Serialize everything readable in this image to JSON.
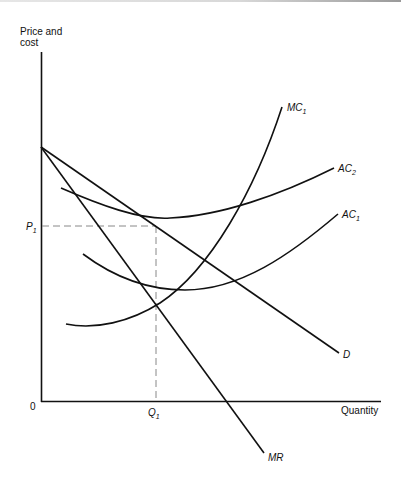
{
  "diagram": {
    "title": "",
    "y_axis_label_line1": "Price and",
    "y_axis_label_line2": "cost",
    "x_axis_label": "Quantity",
    "origin_label": "0",
    "price_marker": {
      "main": "P",
      "sub": "1"
    },
    "quantity_marker": {
      "main": "Q",
      "sub": "1"
    },
    "curves": {
      "mc1": {
        "main": "MC",
        "sub": "1"
      },
      "ac2": {
        "main": "AC",
        "sub": "2"
      },
      "ac1": {
        "main": "AC",
        "sub": "1"
      },
      "d": {
        "main": "D"
      },
      "mr": {
        "main": "MR"
      }
    },
    "colors": {
      "line": "#111111",
      "dashed": "#888888",
      "background": "#ffffff"
    }
  }
}
